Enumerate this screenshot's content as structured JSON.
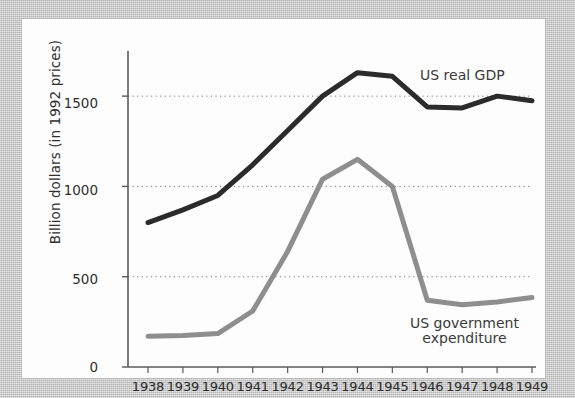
{
  "chart_data": {
    "type": "line",
    "title": "",
    "xlabel": "",
    "ylabel": "Billion dollars (in 1992 prices)",
    "categories": [
      "1938",
      "1939",
      "1940",
      "1941",
      "1942",
      "1943",
      "1944",
      "1945",
      "1946",
      "1947",
      "1948",
      "1949"
    ],
    "x": [
      1938,
      1939,
      1940,
      1941,
      1942,
      1943,
      1944,
      1945,
      1946,
      1947,
      1948,
      1949
    ],
    "series": [
      {
        "name": "US real GDP",
        "color": "#2b2b2b",
        "values": [
          800,
          870,
          950,
          1120,
          1310,
          1500,
          1630,
          1610,
          1440,
          1435,
          1500,
          1475
        ]
      },
      {
        "name": "US government expenditure",
        "color": "#8e8e8e",
        "values": [
          170,
          175,
          185,
          310,
          640,
          1040,
          1150,
          1000,
          370,
          345,
          360,
          385
        ]
      }
    ],
    "yticks": [
      0,
      500,
      1000,
      1500
    ],
    "ytick_labels": [
      "0",
      "500",
      "1000",
      "1500"
    ],
    "ylim": [
      0,
      1750
    ],
    "grid": "horizontal-dotted",
    "grid_levels": [
      500,
      1000,
      1500
    ],
    "legend": "inline-annotations",
    "annotations": [
      {
        "text": "US real GDP",
        "series": "US real GDP"
      },
      {
        "text_line1": "US government",
        "text_line2": "expenditure",
        "series": "US government expenditure"
      }
    ]
  },
  "chart": {
    "y_axis_title": "Billion dollars (in 1992 prices)",
    "y_tick_labels": [
      "1500",
      "1000",
      "500",
      "0"
    ],
    "x_tick_labels": [
      "1938",
      "1939",
      "1940",
      "1941",
      "1942",
      "1943",
      "1944",
      "1945",
      "1946",
      "1947",
      "1948",
      "1949"
    ],
    "annotation_gdp": "US real GDP",
    "annotation_gov_line1": "US government",
    "annotation_gov_line2": "expenditure"
  },
  "colors": {
    "gdp_line": "#2b2b2b",
    "gov_line": "#8e8e8e",
    "axis": "#555555",
    "gridline": "#777777",
    "card_background": "#fdfdfd",
    "page_background": "#c9c9c9"
  }
}
